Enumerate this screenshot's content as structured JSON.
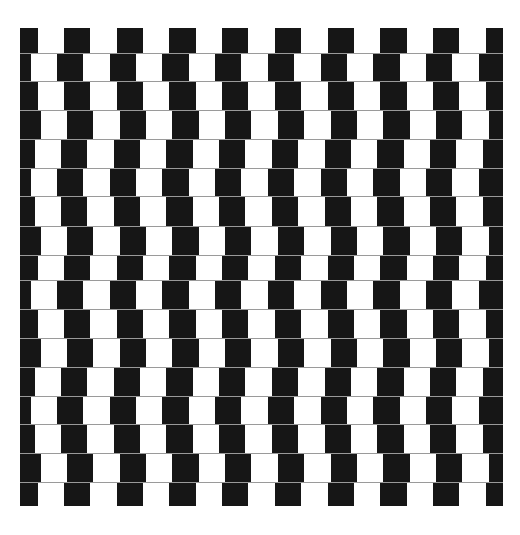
{
  "illusion": {
    "left": 20,
    "top": 28,
    "width": 483,
    "period": 52.7,
    "tile_width": 26.35,
    "tile_color": "#161616",
    "background_color": "#ffffff",
    "mortar_color": "#9a9a9a",
    "row_edges": [
      28,
      53,
      81,
      110,
      139,
      168,
      196,
      226,
      255,
      280,
      309,
      338,
      367,
      396,
      424,
      453,
      482,
      506
    ],
    "row_black_start_x": [
      64,
      57,
      64,
      67,
      61,
      57,
      61,
      67,
      64,
      57,
      64,
      67,
      61,
      57,
      61,
      67,
      64
    ]
  }
}
